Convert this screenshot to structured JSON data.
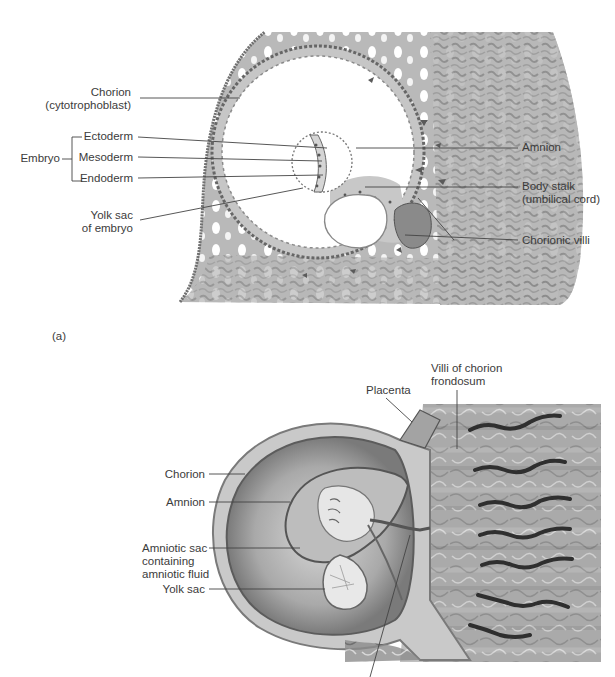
{
  "figure_a": {
    "panel_label": "(a)",
    "labels": {
      "chorion_line1": "Chorion",
      "chorion_line2": "(cytotrophoblast)",
      "embryo": "Embryo",
      "ectoderm": "Ectoderm",
      "mesoderm": "Mesoderm",
      "endoderm": "Endoderm",
      "yolk_sac_line1": "Yolk sac",
      "yolk_sac_line2": "of embryo",
      "amnion": "Amnion",
      "body_stalk_line1": "Body stalk",
      "body_stalk_line2": "(umbilical cord)",
      "chorionic_villi": "Chorionic villi"
    }
  },
  "figure_b": {
    "labels": {
      "placenta": "Placenta",
      "villi_line1": "Villi of chorion",
      "villi_line2": "frondosum",
      "chorion": "Chorion",
      "amnion": "Amnion",
      "amniotic_line1": "Amniotic sac",
      "amniotic_line2": "containing",
      "amniotic_line3": "amniotic fluid",
      "yolk_sac": "Yolk sac"
    }
  },
  "colors": {
    "tissue_gray": "#b4b4b4",
    "dark_tissue": "#6e6e6e",
    "cavity_white": "#ffffff",
    "label_text": "#3b3b3b",
    "leader_line": "#444444"
  }
}
